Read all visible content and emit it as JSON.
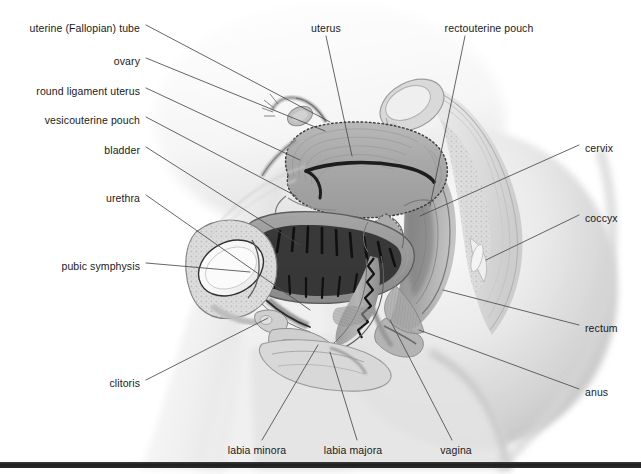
{
  "figure": {
    "background_color": "#ffffff",
    "ink_color": "#1a1a1a",
    "leader_color": "#4a4a4a",
    "rule_color": "#1e1e1e"
  },
  "labels": {
    "left": [
      {
        "text": "uterine (Fallopian) tube",
        "x": 140,
        "y": 28
      },
      {
        "text": "ovary",
        "x": 140,
        "y": 61
      },
      {
        "text": "round ligament uterus",
        "x": 140,
        "y": 91
      },
      {
        "text": "vesicouterine pouch",
        "x": 140,
        "y": 120
      },
      {
        "text": "bladder",
        "x": 140,
        "y": 150
      },
      {
        "text": "urethra",
        "x": 140,
        "y": 198
      },
      {
        "text": "pubic symphysis",
        "x": 140,
        "y": 266
      },
      {
        "text": "clitoris",
        "x": 140,
        "y": 383
      }
    ],
    "right": [
      {
        "text": "cervix",
        "x": 585,
        "y": 148
      },
      {
        "text": "coccyx",
        "x": 585,
        "y": 218
      },
      {
        "text": "rectum",
        "x": 585,
        "y": 328
      },
      {
        "text": "anus",
        "x": 585,
        "y": 392
      }
    ],
    "top": [
      {
        "text": "uterus",
        "x": 326,
        "y": 28
      },
      {
        "text": "rectouterine pouch",
        "x": 489,
        "y": 28
      }
    ],
    "bottom": [
      {
        "text": "labia minora",
        "x": 257,
        "y": 450
      },
      {
        "text": "labia majora",
        "x": 353,
        "y": 450
      },
      {
        "text": "vagina",
        "x": 456,
        "y": 450
      }
    ]
  },
  "leader_lines": [
    {
      "name": "uterine-tube",
      "from": [
        146,
        25
      ],
      "to": [
        330,
        122
      ]
    },
    {
      "name": "ovary",
      "from": [
        146,
        58
      ],
      "to": [
        325,
        131
      ]
    },
    {
      "name": "round-ligament",
      "from": [
        146,
        88
      ],
      "to": [
        300,
        160
      ]
    },
    {
      "name": "vesicouterine-pouch",
      "from": [
        146,
        117
      ],
      "to": [
        296,
        196
      ]
    },
    {
      "name": "bladder",
      "from": [
        146,
        147
      ],
      "to": [
        300,
        245
      ]
    },
    {
      "name": "urethra",
      "from": [
        146,
        195
      ],
      "to": [
        310,
        310
      ]
    },
    {
      "name": "pubic-symphysis",
      "from": [
        146,
        263
      ],
      "to": [
        250,
        272
      ]
    },
    {
      "name": "clitoris",
      "from": [
        146,
        380
      ],
      "to": [
        268,
        318
      ]
    },
    {
      "name": "uterus",
      "from": [
        326,
        36
      ],
      "to": [
        352,
        156
      ]
    },
    {
      "name": "rectouterine-pouch",
      "from": [
        465,
        36
      ],
      "to": [
        430,
        206
      ]
    },
    {
      "name": "cervix",
      "from": [
        579,
        145
      ],
      "to": [
        420,
        216
      ]
    },
    {
      "name": "coccyx",
      "from": [
        579,
        215
      ],
      "to": [
        486,
        260
      ]
    },
    {
      "name": "rectum",
      "from": [
        579,
        325
      ],
      "to": [
        443,
        290
      ]
    },
    {
      "name": "anus",
      "from": [
        579,
        389
      ],
      "to": [
        419,
        330
      ]
    },
    {
      "name": "labia-minora",
      "from": [
        262,
        440
      ],
      "to": [
        318,
        345
      ]
    },
    {
      "name": "labia-majora",
      "from": [
        357,
        440
      ],
      "to": [
        330,
        352
      ]
    },
    {
      "name": "vagina",
      "from": [
        452,
        440
      ],
      "to": [
        390,
        320
      ]
    }
  ],
  "bottom_rule": {
    "y": 462,
    "height": 6
  }
}
